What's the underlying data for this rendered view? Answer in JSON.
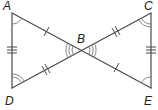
{
  "diagram": {
    "type": "geometry",
    "points": {
      "A": {
        "label": "A",
        "x": 12,
        "y": 13
      },
      "B": {
        "label": "B",
        "x": 81,
        "y": 50
      },
      "C": {
        "label": "C",
        "x": 151,
        "y": 13
      },
      "D": {
        "label": "D",
        "x": 12,
        "y": 88
      },
      "E": {
        "label": "E",
        "x": 151,
        "y": 88
      }
    },
    "segments": [
      {
        "from": "A",
        "to": "B",
        "ticks": 1
      },
      {
        "from": "B",
        "to": "E",
        "ticks": 1
      },
      {
        "from": "D",
        "to": "B",
        "ticks": 2
      },
      {
        "from": "B",
        "to": "C",
        "ticks": 2
      },
      {
        "from": "A",
        "to": "D",
        "ticks": 3
      },
      {
        "from": "C",
        "to": "E",
        "ticks": 3
      }
    ],
    "angles": [
      {
        "vertex": "A",
        "arcs": 1
      },
      {
        "vertex": "E",
        "arcs": 1
      },
      {
        "vertex": "D",
        "arcs": 2
      },
      {
        "vertex": "C",
        "arcs": 2
      },
      {
        "vertex": "B",
        "side": "left",
        "arcs": 3
      },
      {
        "vertex": "B",
        "side": "right",
        "arcs": 3
      }
    ],
    "colors": {
      "line": "#4a4a4a",
      "arc": "#7a7a7a",
      "label": "#222222"
    }
  }
}
